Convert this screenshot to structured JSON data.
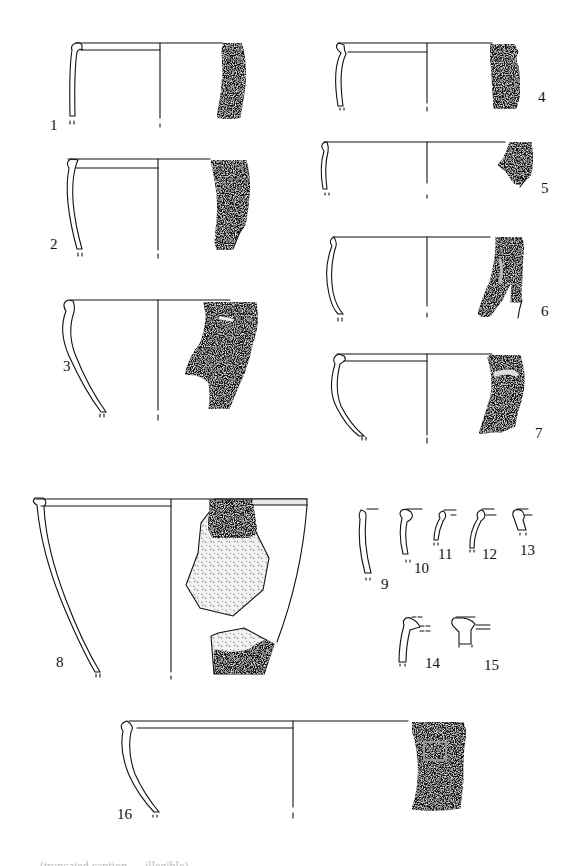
{
  "plate": {
    "type": "archaeological pottery plate",
    "description": "Line drawings of pottery rim sherds: left half shows wall profile with vessel axis, right half shows exterior surface of sherd",
    "colors": {
      "ink": "#111111",
      "background": "#ffffff"
    }
  },
  "figures": [
    {
      "id": 1,
      "label": "1",
      "kind": "profile-and-sherd"
    },
    {
      "id": 2,
      "label": "2",
      "kind": "profile-and-sherd"
    },
    {
      "id": 3,
      "label": "3",
      "kind": "profile-and-sherd"
    },
    {
      "id": 4,
      "label": "4",
      "kind": "profile-and-sherd"
    },
    {
      "id": 5,
      "label": "5",
      "kind": "profile-and-sherd"
    },
    {
      "id": 6,
      "label": "6",
      "kind": "profile-and-sherd"
    },
    {
      "id": 7,
      "label": "7",
      "kind": "profile-and-sherd"
    },
    {
      "id": 8,
      "label": "8",
      "kind": "profile-and-sherd"
    },
    {
      "id": 9,
      "label": "9",
      "kind": "rim-profile"
    },
    {
      "id": 10,
      "label": "10",
      "kind": "rim-profile"
    },
    {
      "id": 11,
      "label": "11",
      "kind": "rim-profile"
    },
    {
      "id": 12,
      "label": "12",
      "kind": "rim-profile"
    },
    {
      "id": 13,
      "label": "13",
      "kind": "rim-profile"
    },
    {
      "id": 14,
      "label": "14",
      "kind": "rim-profile"
    },
    {
      "id": 15,
      "label": "15",
      "kind": "rim-profile"
    },
    {
      "id": 16,
      "label": "16",
      "kind": "profile-and-sherd"
    }
  ],
  "caption": {
    "text": "(truncated caption — illegible)"
  }
}
